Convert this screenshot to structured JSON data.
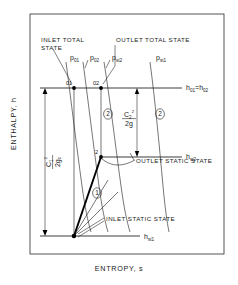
{
  "figure": {
    "kind": "enthalpy-entropy-mollier-diagram",
    "axes": {
      "y_label": "ENTHALPY, h",
      "x_label": "ENTROPY, s"
    },
    "annotations": {
      "inlet_total_state_line1": "INLET TOTAL",
      "inlet_total_state_line2": "STATE",
      "outlet_total_state": "OUTLET TOTAL STATE",
      "outlet_static_state": "OUTLET STATIC STATE",
      "inlet_static_state": "INLET STATIC STATE"
    },
    "pressure_lines": [
      {
        "id": "p01",
        "base": "p",
        "sub": "01"
      },
      {
        "id": "p02",
        "base": "p",
        "sub": "02"
      },
      {
        "id": "pst2",
        "base": "p",
        "sub": "st2"
      },
      {
        "id": "pst1",
        "base": "p",
        "sub": "st1"
      }
    ],
    "state_points": [
      {
        "id": "01",
        "label": "01"
      },
      {
        "id": "02",
        "label": "02"
      },
      {
        "id": "2",
        "label": "2"
      }
    ],
    "enthalpy_levels": [
      {
        "id": "h0",
        "base": "h",
        "sub": "01",
        "eq": "=",
        "base2": "h",
        "sub2": "02"
      },
      {
        "id": "hst2",
        "base": "h",
        "sub": "st2"
      },
      {
        "id": "hst1",
        "base": "h",
        "sub": "st1"
      }
    ],
    "velocity_heads": [
      {
        "id": "inlet-velocity-head",
        "numerator_base": "C",
        "numerator_sub": "1",
        "numerator_sup": "2",
        "denominator": "2g",
        "denominator_sub": "c"
      },
      {
        "id": "outlet-velocity-head",
        "numerator_base": "C",
        "numerator_sub": "2",
        "numerator_sup": "2",
        "denominator": "2g",
        "denominator_sub": ""
      }
    ],
    "process_markers": [
      {
        "id": "marker-1",
        "label": "1"
      },
      {
        "id": "marker-2-left",
        "label": "2"
      },
      {
        "id": "marker-2-right",
        "label": "2"
      }
    ]
  }
}
